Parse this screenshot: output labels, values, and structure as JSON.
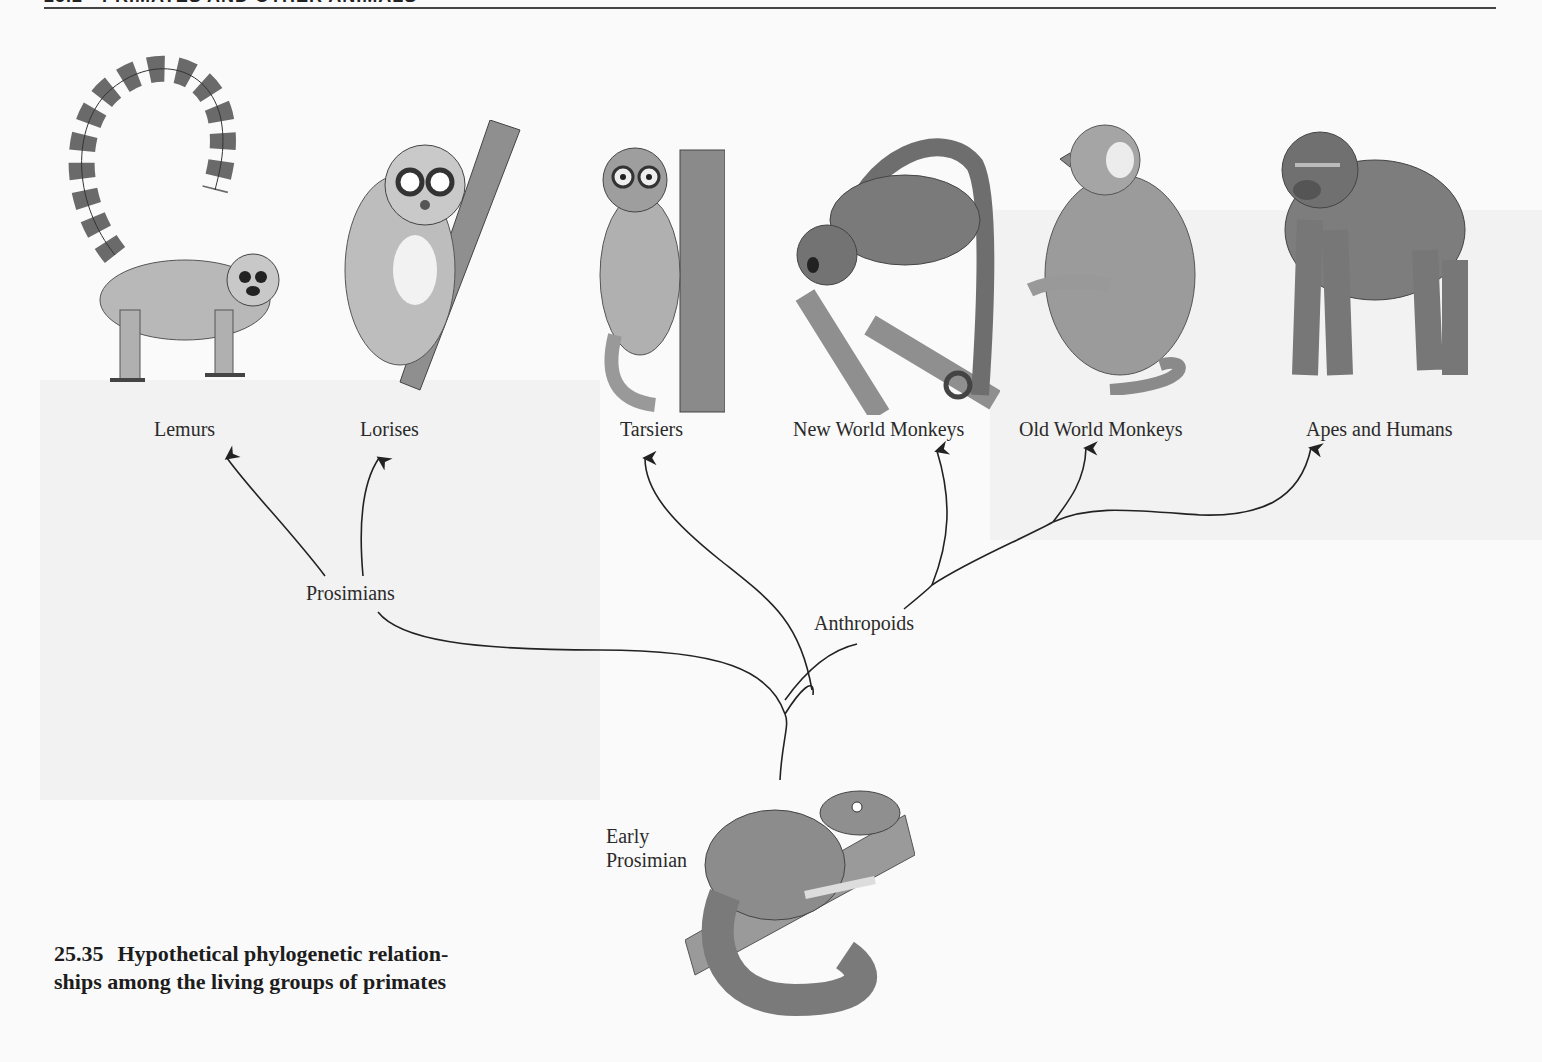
{
  "page": {
    "header_text": "25.2 · PRIMATES AND OTHER ANIMALS",
    "background": "#fafafa"
  },
  "figure": {
    "number": "25.35",
    "caption_line1": "Hypothetical phylogenetic relation-",
    "caption_line2": "ships among the living groups of primates"
  },
  "taxa": [
    {
      "id": "lemurs",
      "label": "Lemurs",
      "group": "Prosimians"
    },
    {
      "id": "lorises",
      "label": "Lorises",
      "group": "Prosimians"
    },
    {
      "id": "tarsiers",
      "label": "Tarsiers",
      "group": "Anthropoids-adjacent"
    },
    {
      "id": "nwm",
      "label": "New World Monkeys",
      "group": "Anthropoids"
    },
    {
      "id": "owm",
      "label": "Old World Monkeys",
      "group": "Anthropoids"
    },
    {
      "id": "apes",
      "label": "Apes and Humans",
      "group": "Anthropoids"
    }
  ],
  "clades": {
    "prosimians": "Prosimians",
    "anthropoids": "Anthropoids",
    "root_line1": "Early",
    "root_line2": "Prosimian"
  },
  "colors": {
    "ink": "#222222",
    "fur_light": "#b5b5b5",
    "fur_mid": "#8a8a8a",
    "fur_dark": "#555555"
  }
}
